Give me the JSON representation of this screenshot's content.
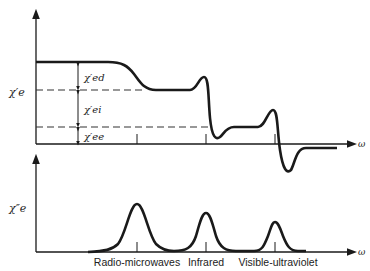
{
  "top_plot": {
    "y_label": "χ′e",
    "x_label": "ω",
    "segments": {
      "ed": "χ′ed",
      "ei": "χ′ei",
      "ee": "χ′ee"
    }
  },
  "bottom_plot": {
    "y_label": "χ″e",
    "x_label": "ω"
  },
  "regions": [
    {
      "label": "Radio-microwaves"
    },
    {
      "label": "Infrared"
    },
    {
      "label": "Visible-ultraviolet"
    }
  ],
  "colors": {
    "ink": "#1a1a1a",
    "dash": "#333333",
    "background": "#ffffff"
  }
}
